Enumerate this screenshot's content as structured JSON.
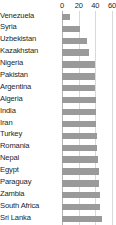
{
  "chart_data": {
    "type": "bar",
    "orientation": "horizontal",
    "title": "",
    "subtitle": "",
    "xlabel": "",
    "ylabel": "",
    "xlim": [
      0,
      60
    ],
    "ylim": null,
    "grid": true,
    "grid_axis": "x",
    "legend": false,
    "legend_position": "none",
    "xticks": [
      0,
      20,
      40,
      60
    ],
    "xtick_labels": [
      "0",
      "20",
      "40",
      "60"
    ],
    "bar_color": "#9a9a9a",
    "gridline_color": "#d9d9d9",
    "axis_color": "#b3b3b3",
    "text_color": "#231f20",
    "categories": [
      "Venezuela",
      "Syria",
      "Uzbekistan",
      "Kazakhstan",
      "Nigeria",
      "Pakistan",
      "Argentina",
      "Algeria",
      "India",
      "Iran",
      "Turkey",
      "Romania",
      "Nepal",
      "Egypt",
      "Paraguay",
      "Zambia",
      "South Africa",
      "Sri Lanka"
    ],
    "values": [
      10,
      22,
      30,
      32,
      39,
      39,
      39,
      41,
      41,
      41,
      42,
      42,
      43,
      44,
      44,
      45,
      46,
      48
    ]
  }
}
